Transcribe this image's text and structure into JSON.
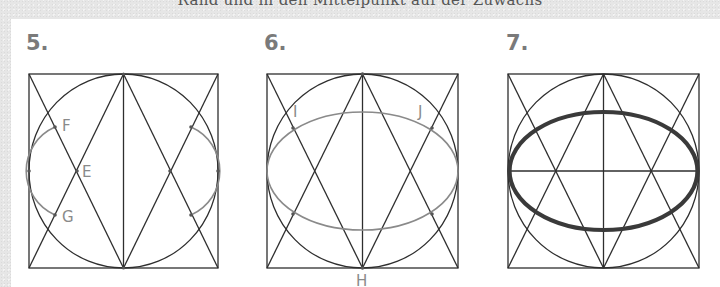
{
  "header": {
    "cut_off_text": "Rand und in den Mittelpunkt auf der Zuwachs"
  },
  "colors": {
    "background": "#e6e6e6",
    "panel": "#ffffff",
    "construction_line": "#2e2e2e",
    "helper_curve": "#8a8a8a",
    "label": "#8a8a8a",
    "step_number": "#7a7a7a",
    "final_ellipse": "#3a3a3a"
  },
  "figures": [
    {
      "step": "5.",
      "square": {
        "x": 29,
        "y": 74,
        "w": 189,
        "h": 194
      },
      "labels": [
        {
          "text": "F",
          "x": 62,
          "y": 131
        },
        {
          "text": "E",
          "x": 82,
          "y": 177
        },
        {
          "text": "G",
          "x": 62,
          "y": 222
        }
      ],
      "description": "Square with inscribed circle, vertical midline, two triangles from top/bottom midpoints; arcs drawn through points F, E, G on both sides"
    },
    {
      "step": "6.",
      "square": {
        "x": 267,
        "y": 74,
        "w": 191,
        "h": 194
      },
      "labels": [
        {
          "text": "I",
          "x": 295,
          "y": 118
        },
        {
          "text": "J",
          "x": 418,
          "y": 118
        },
        {
          "text": "H",
          "x": 356,
          "y": 286
        }
      ],
      "description": "Square with inscribed circle and construction triangles; thin helper ellipse passing through points I and J, center-bottom point H"
    },
    {
      "step": "7.",
      "square": {
        "x": 508,
        "y": 74,
        "w": 191,
        "h": 194
      },
      "labels": [],
      "description": "Completed construction with horizontal and vertical midlines, inscribed circle, triangles, and thick final ellipse"
    }
  ]
}
